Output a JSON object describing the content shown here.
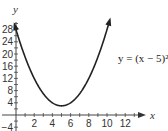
{
  "chart_data": {
    "type": "line",
    "title": "",
    "xlabel": "x",
    "ylabel": "y",
    "function": "y = (x - 5)^2 + 3",
    "annotation": "y = (x − 5)² + 3",
    "vertex": [
      5,
      3
    ],
    "x": [
      0,
      1,
      2,
      3,
      4,
      5,
      6,
      7,
      8,
      9,
      10
    ],
    "series": [
      {
        "name": "y = (x - 5)^2 + 3",
        "values": [
          28,
          19,
          12,
          7,
          4,
          3,
          4,
          7,
          12,
          19,
          28
        ]
      }
    ],
    "xlim": [
      -1,
      13
    ],
    "ylim": [
      -4,
      30
    ],
    "x_ticks": [
      "2",
      "4",
      "6",
      "8",
      "10",
      "12"
    ],
    "y_ticks": [
      "-4",
      "4",
      "8",
      "12",
      "16",
      "20",
      "24",
      "28"
    ],
    "grid": false,
    "legend": "none",
    "color": "#222222"
  }
}
